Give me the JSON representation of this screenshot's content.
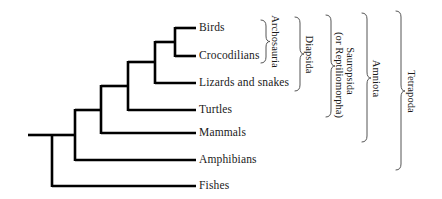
{
  "figure": {
    "type": "cladogram",
    "width": 442,
    "height": 199,
    "line_color": "#000000",
    "text_color": "#1a1a1a",
    "bracket_color": "#555555",
    "background": "#ffffff"
  },
  "taxa": [
    {
      "id": "birds",
      "label": "Birds",
      "y": 28,
      "tip_x": 196
    },
    {
      "id": "crocs",
      "label": "Crocodilians",
      "y": 56,
      "tip_x": 196
    },
    {
      "id": "lizards",
      "label": "Lizards and snakes",
      "y": 83,
      "tip_x": 196
    },
    {
      "id": "turtles",
      "label": "Turtles",
      "y": 110,
      "tip_x": 196
    },
    {
      "id": "mammals",
      "label": "Mammals",
      "y": 133,
      "tip_x": 196
    },
    {
      "id": "amphibians",
      "label": "Amphibians",
      "y": 160,
      "tip_x": 196
    },
    {
      "id": "fishes",
      "label": "Fishes",
      "y": 186,
      "tip_x": 196
    }
  ],
  "nodes": [
    {
      "id": "archosauria-node",
      "x": 175,
      "y_top": 28,
      "y_bottom": 56
    },
    {
      "id": "diapsida-node",
      "x": 155,
      "y_top": 42,
      "y_bottom": 83
    },
    {
      "id": "sauropsida-node",
      "x": 128,
      "y_top": 62,
      "y_bottom": 110
    },
    {
      "id": "amniota-node",
      "x": 101,
      "y_top": 86,
      "y_bottom": 133
    },
    {
      "id": "tetrapoda-node",
      "x": 75,
      "y_top": 110,
      "y_bottom": 160
    },
    {
      "id": "root-node",
      "x": 52,
      "y_top": 135,
      "y_bottom": 186
    }
  ],
  "root_stub": {
    "x_start": 28,
    "x_end": 52,
    "y": 135
  },
  "clades": [
    {
      "id": "archosauria",
      "label": "Archosauria",
      "bracket_x": 265,
      "y_top": 20,
      "y_bottom": 63,
      "label_x": 275,
      "label_cy": 41
    },
    {
      "id": "diapsida",
      "label": "Diapsida",
      "bracket_x": 299,
      "y_top": 17,
      "y_bottom": 91,
      "label_x": 309,
      "label_cy": 54
    },
    {
      "id": "sauropsida",
      "label": "Sauropsida\n(or Reptiliomorpha)",
      "bracket_x": 330,
      "y_top": 15,
      "y_bottom": 117,
      "label_x": 345,
      "label_cy": 66
    },
    {
      "id": "amniota",
      "label": "Amniota",
      "bracket_x": 366,
      "y_top": 13,
      "y_bottom": 142,
      "label_x": 376,
      "label_cy": 78
    },
    {
      "id": "tetrapoda",
      "label": "Tetrapoda",
      "bracket_x": 400,
      "y_top": 11,
      "y_bottom": 170,
      "label_x": 411,
      "label_cy": 91
    }
  ],
  "clade_lines": {
    "sauropsida_line1": "Sauropsida",
    "sauropsida_line2": "(or Reptiliomorpha)"
  }
}
